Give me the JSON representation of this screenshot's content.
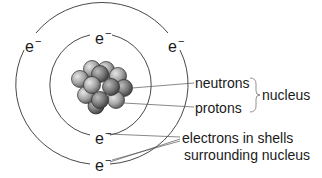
{
  "diagram": {
    "title": "",
    "type": "atom-structure",
    "electron_symbol": "e",
    "electron_charge": "−",
    "electrons": [
      {
        "shell": "outer",
        "position": "left"
      },
      {
        "shell": "inner",
        "position": "top"
      },
      {
        "shell": "outer",
        "position": "right"
      },
      {
        "shell": "inner",
        "position": "bottom"
      },
      {
        "shell": "outer",
        "position": "bottom"
      }
    ],
    "labels": {
      "neutrons": "neutrons",
      "protons": "protons",
      "nucleus": "nucleus",
      "electrons_line1": "electrons in shells",
      "electrons_line2": "surrounding nucleus"
    },
    "colors": {
      "line": "#333333",
      "particle_light": "#d8d8d8",
      "particle_dark": "#6a6a6a",
      "text": "#1a1a1a"
    }
  }
}
